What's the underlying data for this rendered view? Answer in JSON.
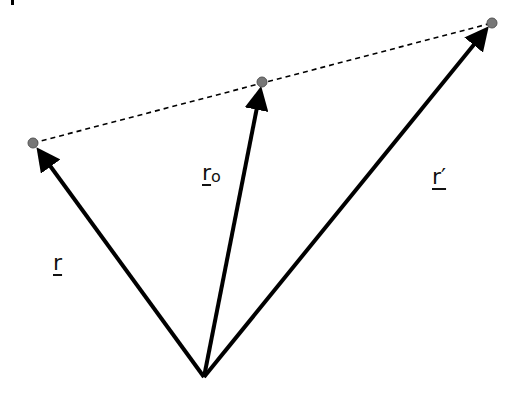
{
  "diagram": {
    "type": "vector-diagram",
    "origin": {
      "x": 204,
      "y": 377
    },
    "vectors": [
      {
        "id": "r",
        "label": "r",
        "tip": {
          "x": 33,
          "y": 143
        }
      },
      {
        "id": "r0",
        "label": "r",
        "subscript": "o",
        "tip": {
          "x": 262,
          "y": 82
        }
      },
      {
        "id": "r_prime",
        "label": "r′",
        "tip": {
          "x": 492,
          "y": 23
        }
      }
    ],
    "dashed_line": {
      "from": {
        "x": 33,
        "y": 143
      },
      "to": {
        "x": 492,
        "y": 23
      }
    },
    "point_color": "#777777",
    "line_color": "#000000"
  },
  "labels": {
    "r": "r",
    "r0_main": "r",
    "r0_sub": "o",
    "r_prime": "r′"
  }
}
